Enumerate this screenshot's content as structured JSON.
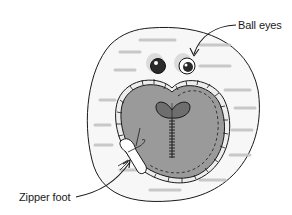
{
  "figure": {
    "callouts": [
      {
        "id": "ball-eyes",
        "label": "Ball eyes"
      },
      {
        "id": "zipper-foot",
        "label": "Zipper foot"
      }
    ],
    "colors": {
      "line": "#1a1a1a",
      "fabric_base": "#f2f2f2",
      "heart_fill": "#9a9a9a",
      "nose_fill": "#6e6e6e",
      "background": "#ffffff"
    }
  }
}
